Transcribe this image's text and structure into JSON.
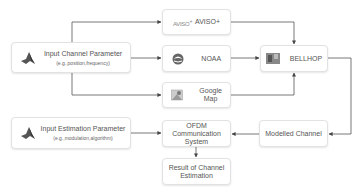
{
  "nodes": {
    "input_channel": {
      "title": "Input Channel Parameter",
      "subtitle": "(e.g.,position,frequency)",
      "icon": "matlab-icon"
    },
    "input_estimation": {
      "title": "Input Estimation Parameter",
      "subtitle": "(e.g.,modulation,algorithm)",
      "icon": "matlab-icon"
    },
    "aviso": {
      "logo_text": "AVISO",
      "logo_sup": "+",
      "label": "AVISO+",
      "icon": "aviso-logo-icon"
    },
    "noaa": {
      "label": "NOAA",
      "icon": "noaa-logo-icon"
    },
    "google_map": {
      "label_line1": "Google",
      "label_line2": "Map",
      "icon": "google-maps-icon"
    },
    "bellhop": {
      "label": "BELLHOP",
      "icon": "bellhop-image-icon"
    },
    "ofdm": {
      "label_line1": "OFDM",
      "label_line2": "Communication",
      "label_line3": "System"
    },
    "modelled_channel": {
      "label": "Modelled Channel"
    },
    "result": {
      "label_line1": "Result of Channel",
      "label_line2": "Estimation"
    }
  },
  "edges": [
    {
      "from": "input_channel",
      "to": "aviso"
    },
    {
      "from": "input_channel",
      "to": "noaa"
    },
    {
      "from": "input_channel",
      "to": "google_map"
    },
    {
      "from": "aviso",
      "to": "bellhop"
    },
    {
      "from": "noaa",
      "to": "bellhop"
    },
    {
      "from": "google_map",
      "to": "bellhop"
    },
    {
      "from": "bellhop",
      "to": "modelled_channel"
    },
    {
      "from": "modelled_channel",
      "to": "ofdm"
    },
    {
      "from": "input_estimation",
      "to": "ofdm"
    },
    {
      "from": "ofdm",
      "to": "result"
    }
  ],
  "colors": {
    "line": "#444444",
    "box_border": "#e2e2e2",
    "text": "#555555"
  }
}
